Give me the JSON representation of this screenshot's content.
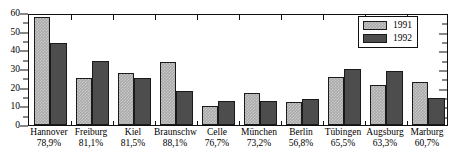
{
  "chart_data": {
    "type": "bar",
    "title": "",
    "subtitle": "",
    "xlabel": "",
    "ylabel": "",
    "ylim": [
      0,
      60
    ],
    "ytick_labels": [
      "0",
      "10",
      "20",
      "30",
      "40",
      "50",
      "60"
    ],
    "ytick_values": [
      0,
      10,
      20,
      30,
      40,
      50,
      60
    ],
    "yminor_values": [
      5,
      15,
      25,
      35,
      45,
      55
    ],
    "grid": false,
    "legend_position": "top-right",
    "categories": [
      "Hannover",
      "Freiburg",
      "Kiel",
      "Braunschw",
      "Celle",
      "München",
      "Berlin",
      "Tübingen",
      "Augsburg",
      "Marburg"
    ],
    "category_sublabels": [
      "78,9%",
      "81,1%",
      "81,5%",
      "88,1%",
      "76,7%",
      "73,2%",
      "56,8%",
      "65,5%",
      "63,3%",
      "60,7%"
    ],
    "series": [
      {
        "name": "1991",
        "color": "#a9a9a9",
        "values": [
          58,
          25,
          28,
          33.5,
          10,
          17,
          12.5,
          25.5,
          21.5,
          23
        ]
      },
      {
        "name": "1992",
        "color": "#4d4d4d",
        "values": [
          44,
          34.5,
          25,
          18,
          13,
          13,
          14,
          30,
          29,
          14.5
        ]
      }
    ]
  },
  "legend": {
    "items": [
      {
        "label": "1991",
        "series_key": "y1991"
      },
      {
        "label": "1992",
        "series_key": "y1992"
      }
    ]
  }
}
